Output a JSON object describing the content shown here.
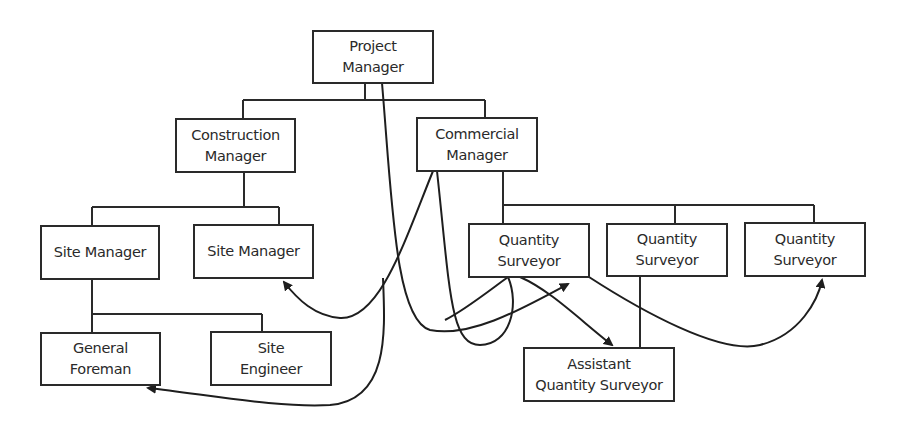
{
  "diagram": {
    "type": "organisation-chart",
    "colors": {
      "line": "#2a2a2a",
      "background": "#ffffff"
    },
    "nodes": {
      "project_manager": {
        "line1": "Project",
        "line2": "Manager"
      },
      "construction_manager": {
        "line1": "Construction",
        "line2": "Manager"
      },
      "commercial_manager": {
        "line1": "Commercial",
        "line2": "Manager"
      },
      "site_manager_1": {
        "line1": "Site Manager"
      },
      "site_manager_2": {
        "line1": "Site Manager"
      },
      "quantity_surveyor_1": {
        "line1": "Quantity",
        "line2": "Surveyor"
      },
      "quantity_surveyor_2": {
        "line1": "Quantity",
        "line2": "Surveyor"
      },
      "quantity_surveyor_3": {
        "line1": "Quantity",
        "line2": "Surveyor"
      },
      "general_foreman": {
        "line1": "General",
        "line2": "Foreman"
      },
      "site_engineer": {
        "line1": "Site",
        "line2": "Engineer"
      },
      "assistant_quantity_surveyor": {
        "line1": "Assistant",
        "line2": "Quantity Surveyor"
      }
    },
    "hierarchy_edges": [
      [
        "project_manager",
        "construction_manager"
      ],
      [
        "project_manager",
        "commercial_manager"
      ],
      [
        "construction_manager",
        "site_manager_1"
      ],
      [
        "construction_manager",
        "site_manager_2"
      ],
      [
        "site_manager_1",
        "general_foreman"
      ],
      [
        "site_manager_1",
        "site_engineer"
      ],
      [
        "commercial_manager",
        "quantity_surveyor_1"
      ],
      [
        "commercial_manager",
        "quantity_surveyor_2"
      ],
      [
        "commercial_manager",
        "quantity_surveyor_3"
      ],
      [
        "quantity_surveyor_2",
        "assistant_quantity_surveyor"
      ]
    ],
    "communication_arrows": [
      [
        "project_manager",
        "quantity_surveyor_1"
      ],
      [
        "commercial_manager",
        "site_manager_2"
      ],
      [
        "commercial_manager",
        "quantity_surveyor_1"
      ],
      [
        "quantity_surveyor_1",
        "assistant_quantity_surveyor"
      ],
      [
        "quantity_surveyor_1",
        "quantity_surveyor_3"
      ],
      [
        "site_engineer_area",
        "general_foreman"
      ]
    ]
  }
}
